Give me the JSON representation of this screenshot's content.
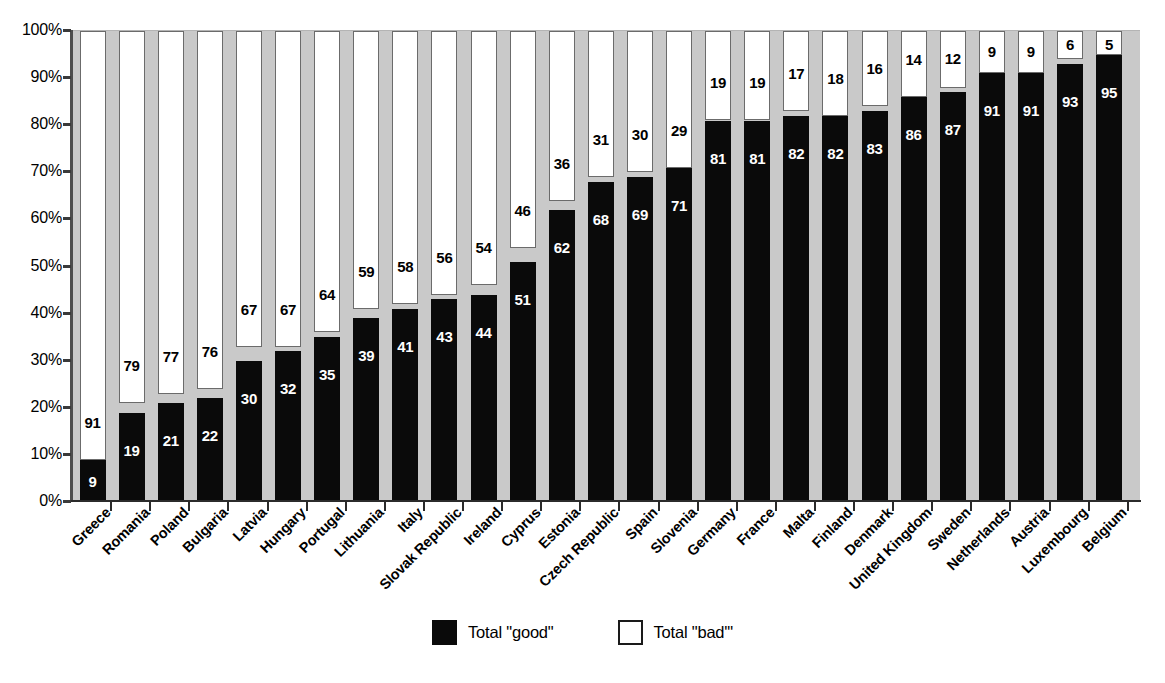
{
  "chart_data": {
    "type": "bar",
    "subtype": "stacked-100-percent",
    "title": "",
    "xlabel": "",
    "ylabel": "",
    "ylim": [
      0,
      100
    ],
    "y_tick_labels": [
      "100%",
      "90%",
      "80%",
      "70%",
      "60%",
      "50%",
      "40%",
      "30%",
      "20%",
      "10%",
      "0%"
    ],
    "y_ticks": [
      100,
      90,
      80,
      70,
      60,
      50,
      40,
      30,
      20,
      10,
      0
    ],
    "grid": false,
    "legend_position": "bottom-center",
    "categories": [
      "Greece",
      "Romania",
      "Poland",
      "Bulgaria",
      "Latvia",
      "Hungary",
      "Portugal",
      "Lithuania",
      "Italy",
      "Slovak Republic",
      "Ireland",
      "Cyprus",
      "Estonia",
      "Czech Republic",
      "Spain",
      "Slovenia",
      "Germany",
      "France",
      "Malta",
      "Finland",
      "Denmark",
      "United Kingdom",
      "Sweden",
      "Netherlands",
      "Austria",
      "Luxembourg",
      "Belgium"
    ],
    "series": [
      {
        "name": "Total \"good\"",
        "color": "#0a0a0a",
        "values": [
          9,
          19,
          21,
          22,
          30,
          32,
          35,
          39,
          41,
          43,
          44,
          51,
          62,
          68,
          69,
          71,
          81,
          81,
          82,
          82,
          83,
          86,
          87,
          91,
          91,
          93,
          95
        ]
      },
      {
        "name": "Total \"bad'\"",
        "color": "#ffffff",
        "values": [
          91,
          79,
          77,
          76,
          67,
          67,
          64,
          59,
          58,
          56,
          54,
          46,
          36,
          31,
          30,
          29,
          19,
          19,
          17,
          18,
          16,
          14,
          12,
          9,
          9,
          6,
          5
        ]
      }
    ]
  },
  "legend": {
    "entries": [
      {
        "label": "Total \"good\"",
        "swatch": "black-square"
      },
      {
        "label": "Total \"bad'\"",
        "swatch": "white-square"
      }
    ]
  },
  "colors": {
    "plot_background": "#c9c9c9",
    "good_bar": "#0a0a0a",
    "bad_bar": "#ffffff",
    "axis": "#2b2b2b",
    "page_background": "#ffffff"
  }
}
